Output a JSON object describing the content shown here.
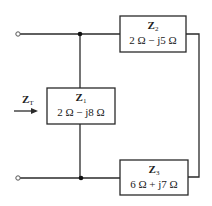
{
  "diagram": {
    "type": "circuit",
    "input": {
      "label": "Z",
      "label_sub": "T",
      "arrow": "right-arrow"
    },
    "impedances": [
      {
        "id": "Z1",
        "name": "Z",
        "sub": "1",
        "value": "2 Ω − j8 Ω",
        "position": "shunt"
      },
      {
        "id": "Z2",
        "name": "Z",
        "sub": "2",
        "value": "2 Ω − j5 Ω",
        "position": "top-series"
      },
      {
        "id": "Z3",
        "name": "Z",
        "sub": "3",
        "value": "6 Ω + j7 Ω",
        "position": "bottom-series"
      }
    ],
    "connections": "Z1 in parallel with series combination of Z2 and Z3"
  }
}
